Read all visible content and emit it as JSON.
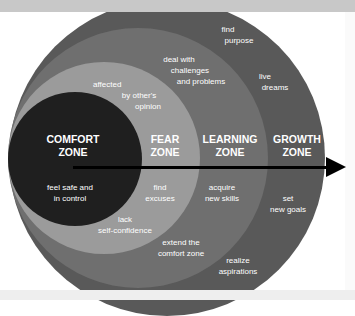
{
  "colors": {
    "comfort": "#1f1f1f",
    "fear": "#9b9b9b",
    "learning": "#6f6f6f",
    "growth": "#595959",
    "arrow": "#000000",
    "text": "#ffffff"
  },
  "zones": [
    {
      "title_line1": "COMFORT",
      "title_line2": "ZONE"
    },
    {
      "title_line1": "FEAR",
      "title_line2": "ZONE"
    },
    {
      "title_line1": "LEARNING",
      "title_line2": "ZONE"
    },
    {
      "title_line1": "GROWTH",
      "title_line2": "ZONE"
    }
  ],
  "labels": {
    "comfort": [
      {
        "line1": "feel safe and",
        "line2": "in control"
      }
    ],
    "fear": [
      {
        "line1": "affected",
        "line2": "by other's",
        "line3": "opinion"
      },
      {
        "line1": "find",
        "line2": "excuses"
      },
      {
        "line1": "lack",
        "line2": "self-confidence"
      }
    ],
    "learning": [
      {
        "line1": "deal with",
        "line2": "challenges",
        "line3": "and problems"
      },
      {
        "line1": "acquire",
        "line2": "new skills"
      },
      {
        "line1": "extend the",
        "line2": "comfort zone"
      }
    ],
    "growth": [
      {
        "line1": "find",
        "line2": "purpose"
      },
      {
        "line1": "live",
        "line2": "dreams"
      },
      {
        "line1": "set",
        "line2": "new goals"
      },
      {
        "line1": "realize",
        "line2": "aspirations"
      }
    ]
  }
}
